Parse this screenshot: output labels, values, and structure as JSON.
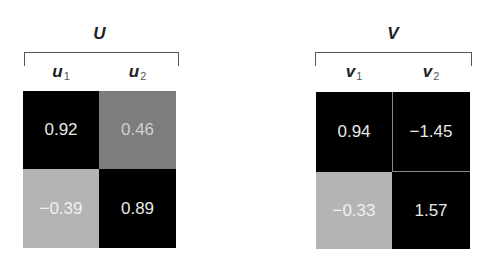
{
  "matrices": [
    {
      "name": "U",
      "columns": [
        {
          "symbol": "u",
          "subscript": "1"
        },
        {
          "symbol": "u",
          "subscript": "2"
        }
      ],
      "cells": [
        [
          "0.92",
          "0.46"
        ],
        [
          "−0.39",
          "0.89"
        ]
      ]
    },
    {
      "name": "V",
      "columns": [
        {
          "symbol": "v",
          "subscript": "1"
        },
        {
          "symbol": "v",
          "subscript": "2"
        }
      ],
      "cells": [
        [
          "0.94",
          "−1.45"
        ],
        [
          "−0.33",
          "1.57"
        ]
      ]
    }
  ],
  "colors": {
    "dark_cell": "#000000",
    "mid_cell": "#7d7d7d",
    "light_cell": "#b4b4b4"
  }
}
